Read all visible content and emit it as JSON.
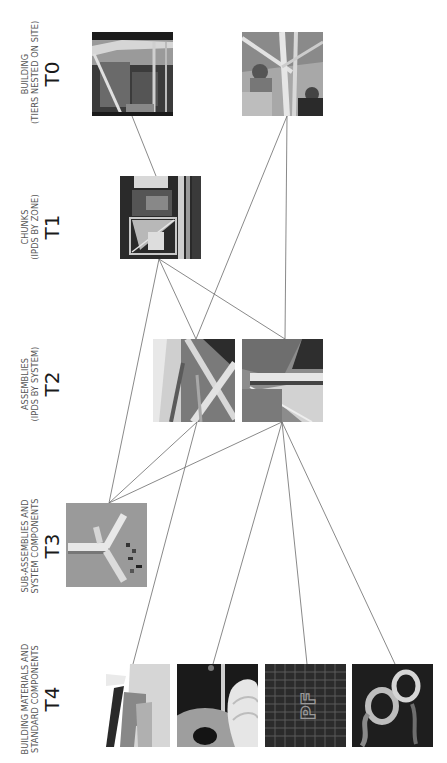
{
  "tiers": [
    {
      "code": "T0",
      "line1": "BUILDING",
      "line2": "(TIERS NESTED ON SITE)"
    },
    {
      "code": "T1",
      "line1": "CHUNKS",
      "line2": "(IPDS BY ZONE)"
    },
    {
      "code": "T2",
      "line1": "ASSEMBLIES",
      "line2": "(IPDS BY SYSTEM)"
    },
    {
      "code": "T3",
      "line1": "SUB-ASSEMBLIES AND",
      "line2": "SYSTEM COMPONENTS"
    },
    {
      "code": "T4",
      "line1": "BUILDING MATERIALS AND",
      "line2": "STANDARD COMPONENTS"
    }
  ],
  "nodes": [
    {
      "id": "t0a",
      "tier": "T0",
      "image": "building-frame-photo"
    },
    {
      "id": "t0b",
      "tier": "T0",
      "image": "workers-on-frame-photo"
    },
    {
      "id": "t1a",
      "tier": "T1",
      "image": "chunk-frame-photo"
    },
    {
      "id": "t2a",
      "tier": "T2",
      "image": "assembly-diagonal-struts-photo"
    },
    {
      "id": "t2b",
      "tier": "T2",
      "image": "assembly-rail-panel-photo"
    },
    {
      "id": "t3a",
      "tier": "T3",
      "image": "aluminum-extrusion-connectors-photo"
    },
    {
      "id": "t4a",
      "tier": "T4",
      "image": "translucent-panel-photo"
    },
    {
      "id": "t4b",
      "tier": "T4",
      "image": "film-rolls-photo"
    },
    {
      "id": "t4c",
      "tier": "T4",
      "image": "pf-grid-mesh-photo"
    },
    {
      "id": "t4d",
      "tier": "T4",
      "image": "tape-rolls-photo"
    }
  ],
  "edges": [
    [
      "t0a",
      "t1a"
    ],
    [
      "t0b",
      "t2a"
    ],
    [
      "t0b",
      "t2b"
    ],
    [
      "t1a",
      "t2a"
    ],
    [
      "t1a",
      "t2b"
    ],
    [
      "t1a",
      "t3a"
    ],
    [
      "t2a",
      "t3a"
    ],
    [
      "t2a",
      "t4a"
    ],
    [
      "t2b",
      "t3a"
    ],
    [
      "t2b",
      "t4b"
    ],
    [
      "t2b",
      "t4c"
    ],
    [
      "t2b",
      "t4d"
    ]
  ],
  "colors": {
    "line": "#6b6b6b",
    "text": "#1a1a1a",
    "subtext": "#555555"
  }
}
